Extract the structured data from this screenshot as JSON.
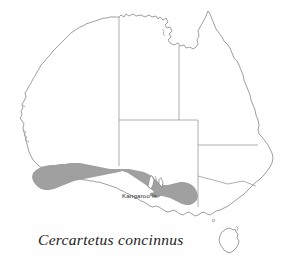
{
  "figure": {
    "type": "species-distribution-map",
    "region": "Australia",
    "caption": "Cercartetus concinnus",
    "background_color": "#fefefe"
  },
  "map": {
    "coastline_color": "#8e8e8e",
    "border_color": "#9a9a9a",
    "land_fill": "#ffffff",
    "range_shade_color": "#9d9d9d",
    "labels": [
      {
        "id": "kangaroo-island",
        "text": "Kangaroo Is."
      }
    ],
    "features": [
      {
        "name": "mainland-australia",
        "kind": "coastline"
      },
      {
        "name": "tasmania",
        "kind": "island"
      },
      {
        "name": "kangaroo-island",
        "kind": "island"
      },
      {
        "name": "state-borders",
        "kind": "boundary"
      },
      {
        "name": "distribution-range",
        "kind": "shaded-area"
      }
    ]
  },
  "legend": {
    "shaded_meaning": "distribution range"
  }
}
